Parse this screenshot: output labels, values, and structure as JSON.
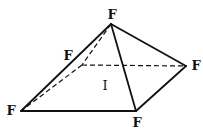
{
  "diagram": {
    "type": "square-pyramid-molecular-geometry",
    "central_atom": {
      "label": "I",
      "x": 105,
      "y": 90
    },
    "vertices": [
      {
        "id": "apex",
        "label": "F",
        "x": 111,
        "y": 24,
        "label_x": 112,
        "label_y": 19
      },
      {
        "id": "back-left",
        "label": "F",
        "x": 82,
        "y": 65,
        "label_x": 68,
        "label_y": 60
      },
      {
        "id": "right",
        "label": "F",
        "x": 186,
        "y": 66,
        "label_x": 196,
        "label_y": 70
      },
      {
        "id": "front-left",
        "label": "F",
        "x": 21,
        "y": 111,
        "label_x": 11,
        "label_y": 115
      },
      {
        "id": "front-right",
        "label": "F",
        "x": 136,
        "y": 111,
        "label_x": 137,
        "label_y": 127
      }
    ],
    "solid_edges": [
      [
        "apex",
        "front-left"
      ],
      [
        "apex",
        "front-right"
      ],
      [
        "apex",
        "right"
      ],
      [
        "front-left",
        "front-right"
      ],
      [
        "front-right",
        "right"
      ]
    ],
    "dashed_edges": [
      [
        "apex",
        "back-left"
      ],
      [
        "back-left",
        "front-left"
      ],
      [
        "back-left",
        "right"
      ]
    ],
    "colors": {
      "line": "#111111",
      "background": "#ffffff"
    }
  }
}
